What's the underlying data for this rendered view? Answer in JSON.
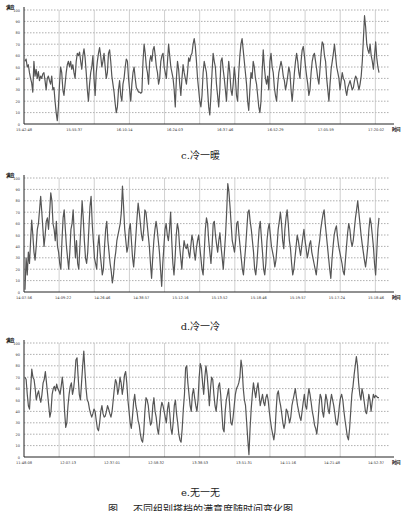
{
  "figure": {
    "caption": "图 ... 不同组别搭档的满意度随时间变化图",
    "line_color": "#555555",
    "grid_color": "#9a9a9a"
  },
  "chart_data": [
    {
      "id": "c",
      "type": "line",
      "caption": "c.冷一暖",
      "title": "",
      "ylabel": "满意",
      "xlabel": "时间",
      "ylim": [
        0,
        100
      ],
      "yticks": [
        0,
        10,
        20,
        30,
        40,
        50,
        60,
        70,
        80,
        90,
        100
      ],
      "xticks": [
        "15:42:48",
        "15:55:37",
        "16:10:14",
        "16:24:03",
        "16:37:46",
        "16:52:29",
        "17:05:59",
        "17:20:02"
      ],
      "grid": true,
      "legend": "none",
      "values": [
        55,
        57,
        50,
        52,
        45,
        40,
        36,
        28,
        55,
        42,
        48,
        40,
        46,
        38,
        42,
        40,
        44,
        45,
        38,
        30,
        40,
        42,
        38,
        35,
        42,
        30,
        32,
        20,
        10,
        3,
        15,
        35,
        50,
        45,
        30,
        25,
        35,
        45,
        52,
        55,
        50,
        55,
        48,
        52,
        45,
        40,
        55,
        62,
        60,
        63,
        55,
        48,
        60,
        66,
        58,
        45,
        30,
        20,
        35,
        45,
        50,
        60,
        40,
        25,
        45,
        55,
        62,
        67,
        60,
        50,
        55,
        62,
        50,
        40,
        45,
        62,
        65,
        55,
        42,
        35,
        28,
        18,
        10,
        15,
        30,
        38,
        25,
        20,
        35,
        40,
        50,
        57,
        55,
        40,
        30,
        20,
        35,
        45,
        50,
        40,
        32,
        30,
        28,
        28,
        27,
        28,
        55,
        70,
        62,
        50,
        45,
        35,
        55,
        60,
        55,
        65,
        68,
        60,
        50,
        45,
        35,
        40,
        55,
        60,
        62,
        50,
        45,
        40,
        55,
        70,
        60,
        50,
        45,
        40,
        30,
        15,
        40,
        55,
        48,
        35,
        25,
        40,
        52,
        45,
        40,
        35,
        45,
        58,
        55,
        60,
        62,
        70,
        75,
        68,
        55,
        40,
        30,
        20,
        15,
        25,
        45,
        55,
        50,
        45,
        30,
        15,
        8,
        25,
        45,
        62,
        55,
        50,
        35,
        25,
        15,
        30,
        55,
        58,
        48,
        40,
        30,
        20,
        40,
        55,
        45,
        30,
        25,
        35,
        50,
        40,
        25,
        20,
        45,
        60,
        70,
        75,
        65,
        55,
        45,
        35,
        20,
        12,
        30,
        45,
        40,
        55,
        50,
        40,
        35,
        25,
        15,
        10,
        20,
        45,
        65,
        50,
        40,
        35,
        42,
        30,
        55,
        62,
        50,
        45,
        32,
        25,
        20,
        35,
        45,
        50,
        55,
        50,
        42,
        38,
        30,
        35,
        42,
        50,
        45,
        30,
        20,
        32,
        45,
        55,
        62,
        55,
        45,
        40,
        55,
        65,
        68,
        60,
        50,
        42,
        35,
        25,
        30,
        45,
        55,
        60,
        62,
        55,
        48,
        40,
        35,
        48,
        62,
        72,
        70,
        60,
        55,
        40,
        30,
        20,
        35,
        48,
        55,
        62,
        70,
        60,
        50,
        45,
        40,
        30,
        38,
        45,
        40,
        38,
        30,
        25,
        32,
        35,
        38,
        34,
        30,
        32,
        38,
        42,
        40,
        35,
        30,
        35,
        42,
        55,
        75,
        95,
        85,
        70,
        65,
        62,
        70,
        60,
        55,
        48,
        60,
        72,
        58,
        50,
        45
      ],
      "series_style": {
        "color": "#555555",
        "width": 1.2
      }
    },
    {
      "id": "d",
      "type": "line",
      "caption": "d.冷一冷",
      "title": "",
      "ylabel": "满意",
      "xlabel": "时间",
      "ylim": [
        0,
        100
      ],
      "yticks": [
        0,
        10,
        20,
        30,
        40,
        50,
        60,
        70,
        80,
        90,
        100
      ],
      "xticks": [
        "14:07:56",
        "14:09:22",
        "14:26:46",
        "14:38:57",
        "15:12:16",
        "15:13:52",
        "15:18:46",
        "15:19:57",
        "15:17:24",
        "15:18:46"
      ],
      "grid": true,
      "legend": "none",
      "values": [
        2,
        30,
        15,
        35,
        25,
        45,
        63,
        50,
        35,
        28,
        40,
        55,
        60,
        72,
        84,
        70,
        55,
        40,
        50,
        62,
        65,
        55,
        70,
        87,
        80,
        60,
        55,
        45,
        62,
        40,
        35,
        25,
        20,
        45,
        65,
        72,
        55,
        40,
        30,
        20,
        35,
        55,
        60,
        72,
        50,
        30,
        45,
        25,
        20,
        40,
        60,
        80,
        65,
        45,
        30,
        25,
        35,
        55,
        75,
        84,
        60,
        45,
        30,
        25,
        20,
        40,
        50,
        35,
        25,
        15,
        20,
        40,
        55,
        62,
        45,
        35,
        25,
        18,
        8,
        15,
        28,
        35,
        45,
        50,
        55,
        60,
        70,
        93,
        75,
        55,
        45,
        35,
        40,
        55,
        60,
        45,
        30,
        22,
        35,
        50,
        65,
        78,
        70,
        60,
        50,
        45,
        55,
        72,
        70,
        60,
        50,
        40,
        25,
        12,
        30,
        45,
        55,
        62,
        55,
        45,
        35,
        20,
        5,
        25,
        40,
        55,
        60,
        50,
        45,
        55,
        70,
        45,
        25,
        15,
        30,
        50,
        60,
        55,
        40,
        30,
        20,
        35,
        45,
        40,
        38,
        42,
        35,
        30,
        40,
        50,
        45,
        35,
        28,
        38,
        45,
        50,
        40,
        30,
        20,
        15,
        35,
        55,
        65,
        60,
        45,
        35,
        25,
        40,
        60,
        62,
        50,
        42,
        35,
        45,
        52,
        40,
        30,
        20,
        35,
        50,
        70,
        95,
        88,
        75,
        60,
        45,
        40,
        35,
        45,
        60,
        62,
        50,
        40,
        30,
        20,
        15,
        28,
        40,
        55,
        70,
        72,
        62,
        55,
        45,
        35,
        20,
        15,
        25,
        40,
        55,
        62,
        48,
        35,
        20,
        15,
        25,
        45,
        55,
        60,
        50,
        40,
        35,
        30,
        22,
        28,
        40,
        55,
        62,
        70,
        60,
        45,
        38,
        55,
        65,
        72,
        60,
        45,
        38,
        25,
        15,
        20,
        30,
        40,
        50,
        45,
        38,
        32,
        40,
        48,
        55,
        45,
        38,
        30,
        35,
        42,
        45,
        35,
        30,
        25,
        20,
        15,
        25,
        38,
        45,
        55,
        62,
        68,
        72,
        60,
        50,
        40,
        30,
        20,
        12,
        28,
        40,
        50,
        55,
        58,
        48,
        40,
        35,
        30,
        25,
        18,
        15,
        28,
        40,
        52,
        60,
        55,
        45,
        40,
        45,
        55,
        65,
        72,
        80,
        70,
        60,
        50,
        42,
        35,
        28,
        22,
        30,
        40,
        55,
        65,
        60,
        50,
        40,
        25,
        15,
        35,
        55,
        65
      ],
      "series_style": {
        "color": "#555555",
        "width": 1.2
      }
    },
    {
      "id": "e",
      "type": "line",
      "caption": "e.无一无",
      "title": "",
      "ylabel": "满意",
      "xlabel": "时间",
      "ylim": [
        0,
        100
      ],
      "yticks": [
        0,
        10,
        20,
        30,
        40,
        50,
        60,
        70,
        80,
        90,
        100
      ],
      "xticks": [
        "11:48:08",
        "12:07:13",
        "12:37:01",
        "12:58:32",
        "13:38:53",
        "13:51:31",
        "14:11:16",
        "14:21:48",
        "14:52:37"
      ],
      "grid": true,
      "legend": "none",
      "values": [
        70,
        68,
        55,
        45,
        42,
        60,
        77,
        70,
        68,
        60,
        50,
        55,
        58,
        52,
        48,
        55,
        65,
        68,
        75,
        65,
        55,
        45,
        35,
        40,
        55,
        60,
        62,
        58,
        64,
        60,
        58,
        55,
        62,
        70,
        60,
        40,
        26,
        30,
        45,
        55,
        62,
        65,
        55,
        60,
        70,
        85,
        87,
        70,
        55,
        50,
        65,
        80,
        93,
        75,
        60,
        50,
        48,
        42,
        38,
        35,
        38,
        42,
        40,
        32,
        25,
        23,
        30,
        40,
        45,
        38,
        35,
        36,
        40,
        45,
        42,
        38,
        35,
        40,
        50,
        60,
        68,
        65,
        55,
        60,
        70,
        65,
        55,
        62,
        72,
        75,
        65,
        50,
        40,
        30,
        25,
        35,
        48,
        55,
        45,
        40,
        32,
        28,
        20,
        15,
        13,
        22,
        40,
        52,
        50,
        45,
        35,
        28,
        30,
        45,
        52,
        40,
        35,
        25,
        20,
        30,
        42,
        48,
        45,
        40,
        35,
        30,
        42,
        48,
        38,
        25,
        20,
        30,
        45,
        50,
        38,
        30,
        20,
        15,
        13,
        25,
        42,
        55,
        78,
        80,
        65,
        55,
        45,
        40,
        55,
        60,
        52,
        45,
        40,
        50,
        70,
        82,
        78,
        65,
        55,
        70,
        80,
        72,
        60,
        45,
        60,
        70,
        68,
        55,
        45,
        40,
        50,
        62,
        65,
        55,
        40,
        25,
        22,
        40,
        50,
        55,
        60,
        45,
        30,
        28,
        35,
        45,
        55,
        60,
        62,
        65,
        70,
        85,
        78,
        60,
        50,
        45,
        30,
        15,
        2,
        25,
        42,
        55,
        65,
        58,
        52,
        60,
        65,
        55,
        45,
        50,
        55,
        48,
        45,
        52,
        55,
        50,
        40,
        32,
        25,
        20,
        15,
        22,
        40,
        55,
        58,
        50,
        45,
        38,
        30,
        25,
        30,
        42,
        40,
        35,
        30,
        35,
        45,
        50,
        55,
        60,
        52,
        45,
        40,
        35,
        32,
        40,
        48,
        55,
        45,
        42,
        52,
        60,
        55,
        48,
        40,
        35,
        28,
        25,
        20,
        30,
        45,
        55,
        52,
        40,
        35,
        45,
        55,
        50,
        42,
        38,
        48,
        55,
        50,
        45,
        38,
        30,
        28,
        35,
        45,
        52,
        55,
        50,
        40,
        32,
        25,
        18,
        15,
        25,
        40,
        55,
        62,
        72,
        80,
        88,
        80,
        65,
        55,
        50,
        60,
        55,
        48,
        40,
        38,
        45,
        55,
        50,
        40,
        48,
        55,
        52,
        54,
        53,
        52,
        52
      ],
      "series_style": {
        "color": "#555555",
        "width": 1.2
      }
    }
  ]
}
